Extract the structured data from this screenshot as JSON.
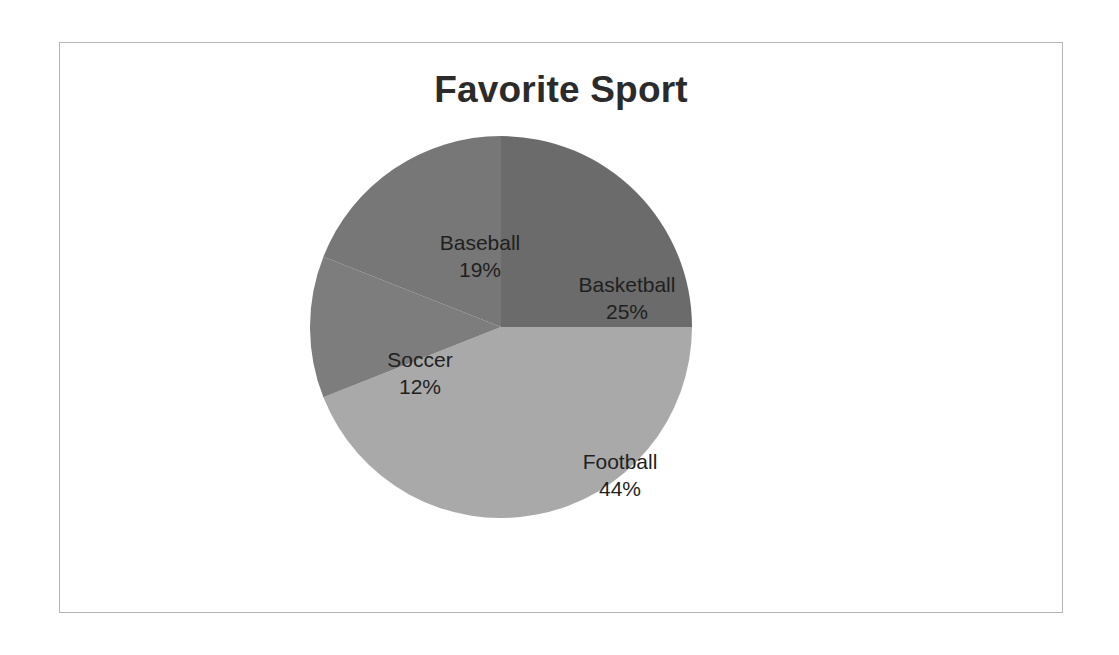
{
  "chart_data": {
    "type": "pie",
    "title": "Favorite Sport",
    "xlabel": "",
    "ylabel": "",
    "legend": "none",
    "labels_on_slices": true,
    "categories": [
      "Basketball",
      "Football",
      "Soccer",
      "Baseball"
    ],
    "values": [
      25,
      44,
      12,
      19
    ],
    "value_unit": "%",
    "slices": [
      {
        "name": "Basketball",
        "value": 25,
        "percent_label": "25%",
        "color": "#6b6b6b",
        "start_angle_deg": 0,
        "end_angle_deg": 90
      },
      {
        "name": "Football",
        "value": 44,
        "percent_label": "44%",
        "color": "#a9a9a9",
        "start_angle_deg": 90,
        "end_angle_deg": 248.4
      },
      {
        "name": "Soccer",
        "value": 12,
        "percent_label": "12%",
        "color": "#7d7d7d",
        "start_angle_deg": 248.4,
        "end_angle_deg": 291.6
      },
      {
        "name": "Baseball",
        "value": 19,
        "percent_label": "19%",
        "color": "#777777",
        "start_angle_deg": 291.6,
        "end_angle_deg": 360
      }
    ]
  },
  "chart": {
    "title": "Favorite Sport",
    "frame_border_color": "#b5b5b5",
    "background_color": "#ffffff",
    "title_color": "#2b2b2b",
    "label_color": "#1f1f1f"
  },
  "labels": {
    "basketball": {
      "name": "Basketball",
      "percent": "25%"
    },
    "baseball": {
      "name": "Baseball",
      "percent": "19%"
    },
    "soccer": {
      "name": "Soccer",
      "percent": "12%"
    },
    "football": {
      "name": "Football",
      "percent": "44%"
    }
  }
}
